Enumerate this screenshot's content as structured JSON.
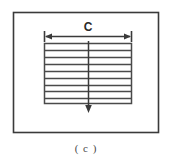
{
  "figure": {
    "caption": "( c )",
    "frame": {
      "x": 13,
      "y": 12,
      "width": 145,
      "height": 120,
      "stroke_color": "#3a3a3a",
      "fill_color": "#ffffff"
    },
    "dimension": {
      "label": "C",
      "label_x": 88,
      "label_y": 31,
      "line_y": 36,
      "x_start": 44,
      "x_end": 132,
      "arrow_style": "double-headed-with-end-ticks",
      "stroke_color": "#3a3a3a"
    },
    "hatched_block": {
      "x": 44,
      "y": 43,
      "width": 88,
      "height": 61,
      "stroke_color": "#4a4a4a",
      "fill_color": "#ffffff",
      "hatch_line_count": 8,
      "hatch_ys": [
        50,
        57,
        64,
        71,
        78,
        85,
        91,
        98
      ]
    },
    "center_arrow": {
      "x": 88,
      "y_start": 41,
      "y_end": 112,
      "direction": "down",
      "stroke_color": "#3a3a3a"
    }
  },
  "colors": {
    "ink": "#3a3a3a",
    "hatch": "#4a4a4a",
    "caption": "#4a4a4a",
    "background": "#ffffff"
  }
}
